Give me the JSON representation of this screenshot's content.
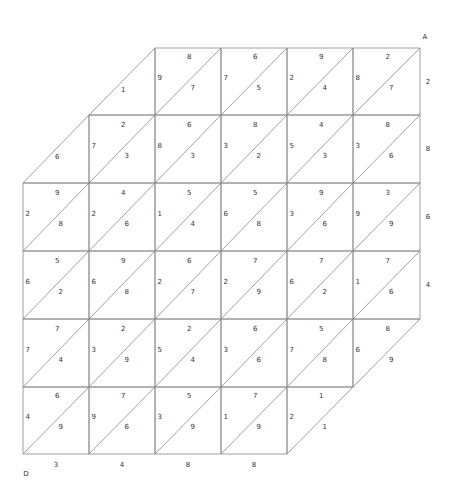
{
  "corners": {
    "top_right": "A",
    "bottom_left": "D"
  },
  "grid": {
    "x": [
      23,
      89,
      155,
      221,
      287,
      353,
      420
    ],
    "y": [
      48,
      115,
      183,
      251,
      319,
      387,
      454
    ]
  },
  "cells": [
    [
      null,
      {
        "bottom": "1",
        "partial": "lower"
      },
      {
        "top": "8",
        "left": "9",
        "bottom": "7"
      },
      {
        "top": "6",
        "left": "7",
        "bottom": "5"
      },
      {
        "top": "9",
        "left": "2",
        "bottom": "4"
      },
      {
        "top": "2",
        "left": "8",
        "bottom": "7"
      }
    ],
    [
      {
        "bottom": "6",
        "partial": "lower"
      },
      {
        "top": "2",
        "left": "7",
        "bottom": "3"
      },
      {
        "top": "6",
        "left": "8",
        "bottom": "3"
      },
      {
        "top": "8",
        "left": "3",
        "bottom": "2"
      },
      {
        "top": "4",
        "left": "5",
        "bottom": "3"
      },
      {
        "top": "8",
        "left": "3",
        "bottom": "6"
      }
    ],
    [
      {
        "top": "9",
        "left": "2",
        "bottom": "8"
      },
      {
        "top": "4",
        "left": "2",
        "bottom": "6"
      },
      {
        "top": "5",
        "left": "1",
        "bottom": "4"
      },
      {
        "top": "5",
        "left": "6",
        "bottom": "8"
      },
      {
        "top": "9",
        "left": "3",
        "bottom": "6"
      },
      {
        "top": "3",
        "left": "9",
        "bottom": "9"
      }
    ],
    [
      {
        "top": "5",
        "left": "6",
        "bottom": "2"
      },
      {
        "top": "9",
        "left": "6",
        "bottom": "8"
      },
      {
        "top": "6",
        "left": "2",
        "bottom": "7"
      },
      {
        "top": "7",
        "left": "2",
        "bottom": "9"
      },
      {
        "top": "7",
        "left": "6",
        "bottom": "2"
      },
      {
        "top": "7",
        "left": "1",
        "bottom": "6"
      }
    ],
    [
      {
        "top": "7",
        "left": "7",
        "bottom": "4"
      },
      {
        "top": "2",
        "left": "3",
        "bottom": "9"
      },
      {
        "top": "2",
        "left": "5",
        "bottom": "4"
      },
      {
        "top": "6",
        "left": "3",
        "bottom": "6"
      },
      {
        "top": "5",
        "left": "7",
        "bottom": "8"
      },
      {
        "top": "8",
        "left": "6",
        "bottom": "9",
        "partial": "upper"
      }
    ],
    [
      {
        "top": "6",
        "left": "4",
        "bottom": "9"
      },
      {
        "top": "7",
        "left": "9",
        "bottom": "6"
      },
      {
        "top": "5",
        "left": "3",
        "bottom": "9"
      },
      {
        "top": "7",
        "left": "1",
        "bottom": "9"
      },
      {
        "top": "1",
        "left": "2",
        "bottom": "1",
        "partial": "upper"
      },
      null
    ]
  ],
  "right_labels": [
    "2",
    "8",
    "6",
    "4"
  ],
  "bottom_labels": [
    "3",
    "4",
    "8",
    "8"
  ]
}
